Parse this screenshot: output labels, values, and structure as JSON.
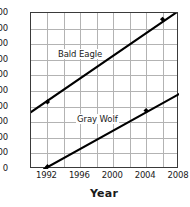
{
  "chart_data": {
    "type": "line",
    "title": "",
    "subtitle": "",
    "xlabel": "Year",
    "ylabel": "",
    "xlim": [
      1990,
      2008
    ],
    "ylim": [
      0,
      1000
    ],
    "grid": true,
    "legend_position": "inline-on-series",
    "x_ticks": [
      1992,
      1996,
      2000,
      2004,
      2008
    ],
    "x_tick_labels": [
      "1992",
      "1996",
      "2000",
      "2004",
      "2008"
    ],
    "x_gridlines": [
      1992,
      1994,
      1996,
      1998,
      2000,
      2002,
      2004,
      2006,
      2008
    ],
    "y_ticks": [
      0,
      100,
      200,
      300,
      400,
      500,
      600,
      700,
      800,
      900,
      1000
    ],
    "y_tick_labels": [
      "0",
      "100",
      "200",
      "300",
      "400",
      "500",
      "600",
      "700",
      "800",
      "900",
      "1000"
    ],
    "series": [
      {
        "name": "Bald Eagle",
        "color": "#000000",
        "x": [
          1990,
          2008
        ],
        "values": [
          365,
          1015
        ],
        "markers": [
          {
            "x": 1992,
            "y": 430
          },
          {
            "x": 2006,
            "y": 960
          }
        ]
      },
      {
        "name": "Gray Wolf",
        "color": "#000000",
        "x": [
          1991.6,
          2008
        ],
        "values": [
          0,
          480
        ],
        "markers": [
          {
            "x": 1992,
            "y": 15
          },
          {
            "x": 2004,
            "y": 375
          }
        ]
      }
    ]
  },
  "axis": {
    "x_title": "Year"
  },
  "style": {
    "axis_color": "#3a3a3a",
    "grid_color": "#b3b3b3",
    "series_color": "#000000",
    "text_color": "#1a1a1a",
    "background": "#ffffff"
  }
}
